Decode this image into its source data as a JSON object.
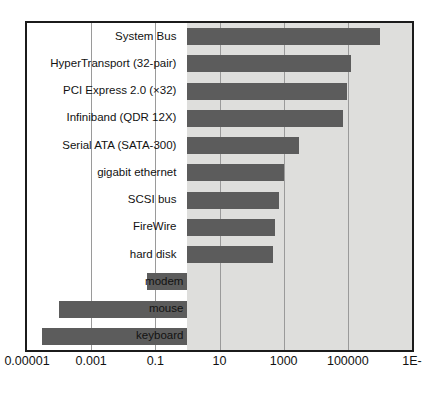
{
  "chart_data": {
    "type": "bar",
    "orientation": "horizontal",
    "title": "",
    "subtitle": "",
    "xlabel": "",
    "ylabel": "",
    "xscale": "log",
    "xlim": [
      1e-05,
      10000000.0
    ],
    "grid": true,
    "legend": null,
    "bar_color": "#5c5c5c",
    "plot_background": "#dededc",
    "frame_color": "#1b1b1b",
    "gridline_color": "#9a9a9a",
    "baseline_value": 1,
    "categories": [
      "System Bus",
      "HyperTransport (32-pair)",
      "PCI Express 2.0 (×32)",
      "Infiniband (QDR 12X)",
      "Serial ATA (SATA-300)",
      "gigabit ethernet",
      "SCSI bus",
      "FireWire",
      "hard disk",
      "modem",
      "mouse",
      "keyboard"
    ],
    "values": [
      1000000,
      130000,
      96000,
      72000,
      3000,
      1000,
      700,
      520,
      470,
      0.056,
      0.0001,
      3e-05
    ],
    "xticks": [
      "0.00001",
      "0.001",
      "0.1",
      "10",
      "1000",
      "100000",
      "1E-"
    ],
    "xtick_values": [
      1e-05,
      0.001,
      0.1,
      10,
      1000,
      100000,
      10000000
    ]
  }
}
